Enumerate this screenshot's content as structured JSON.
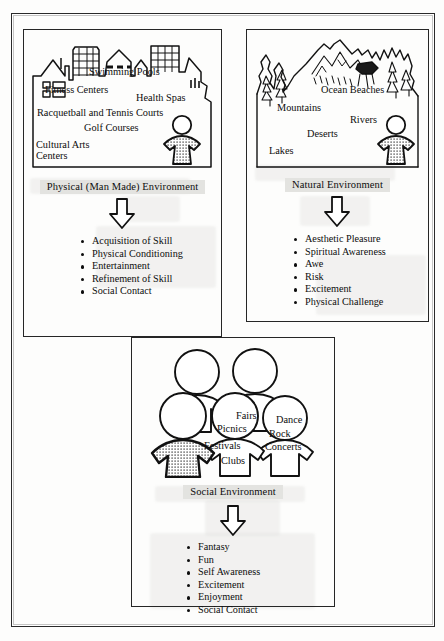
{
  "diagram": {
    "frame": {
      "style": "double-rule-border"
    },
    "panels": [
      {
        "id": "physical",
        "label": "Physical (Man Made) Environment",
        "scene_icon": "city-skyline-icon",
        "figure_icon": "person-figure-icon",
        "scene_words": [
          {
            "text": "Swimming Pools",
            "x": 58,
            "y": 32
          },
          {
            "text": "Fitness Centers",
            "x": 14,
            "y": 49
          },
          {
            "text": "Health Spas",
            "x": 104,
            "y": 58
          },
          {
            "text": "Racquetball and Tennis Courts",
            "x": 10,
            "y": 73
          },
          {
            "text": "Golf Courses",
            "x": 55,
            "y": 90
          },
          {
            "text": "Cultural Arts",
            "x": 8,
            "y": 106
          },
          {
            "text": "Centers",
            "x": 8,
            "y": 118
          }
        ],
        "arrow_icon": "down-arrow-icon",
        "outcomes": [
          "Acquisition of Skill",
          "Physical Conditioning",
          "Entertainment",
          "Refinement of Skill",
          "Social Contact"
        ]
      },
      {
        "id": "natural",
        "label": "Natural Environment",
        "scene_icon": "mountains-and-pines-icon",
        "figure_icon": "person-figure-icon",
        "scene_words": [
          {
            "text": "Ocean Beaches",
            "x": 72,
            "y": 52
          },
          {
            "text": "Mountains",
            "x": 28,
            "y": 70
          },
          {
            "text": "Rivers",
            "x": 100,
            "y": 82
          },
          {
            "text": "Deserts",
            "x": 58,
            "y": 96
          },
          {
            "text": "Lakes",
            "x": 20,
            "y": 113
          }
        ],
        "arrow_icon": "down-arrow-icon",
        "outcomes": [
          "Aesthetic Pleasure",
          "Spiritual Awareness",
          "Awe",
          "Risk",
          "Excitement",
          "Physical Challenge"
        ]
      },
      {
        "id": "social",
        "label": "Social Environment",
        "scene_icon": "group-of-people-icon",
        "figure_icon": "person-figure-icon",
        "scene_words": [
          {
            "text": "Fairs",
            "x": 88,
            "y": 64
          },
          {
            "text": "Dance",
            "x": 131,
            "y": 68
          },
          {
            "text": "Picnics",
            "x": 68,
            "y": 78
          },
          {
            "text": "Rock",
            "x": 122,
            "y": 84
          },
          {
            "text": "Festivals",
            "x": 58,
            "y": 95
          },
          {
            "text": "Concerts",
            "x": 118,
            "y": 97
          },
          {
            "text": "Clubs",
            "x": 72,
            "y": 110
          }
        ],
        "arrow_icon": "down-arrow-icon",
        "outcomes": [
          "Fantasy",
          "Fun",
          "Self Awareness",
          "Excitement",
          "Enjoyment",
          "Social Contact"
        ]
      }
    ],
    "colors": {
      "ink": "#0d0d0d",
      "rule": "#262626",
      "paper": "#fdfdfc",
      "highlight": "#e3e3e0",
      "figure_fill": "#c9c9c9"
    }
  }
}
